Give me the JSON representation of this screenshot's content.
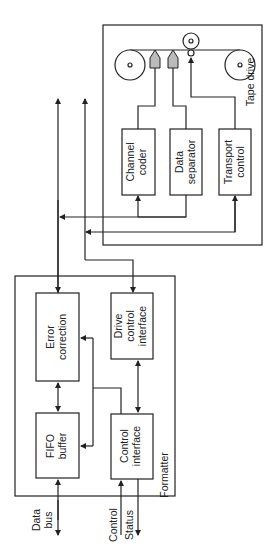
{
  "diagram": {
    "orientation": "rotated 90° counter-clockwise",
    "colors": {
      "line": "#222222",
      "head_fill": "#bbbbbb",
      "background": "#ffffff"
    },
    "formatter": {
      "label": "Formatter",
      "blocks": {
        "fifo": [
          "FIFO",
          "buffer"
        ],
        "error": [
          "Error",
          "correction"
        ],
        "control": [
          "Control",
          "interface"
        ],
        "drive": [
          "Drive",
          "control",
          "interface"
        ]
      }
    },
    "tape_drive": {
      "label": "Tape drive",
      "blocks": {
        "coder": [
          "Channel",
          "coder"
        ],
        "separator": [
          "Data",
          "separator"
        ],
        "transport": [
          "Transport",
          "control"
        ]
      }
    },
    "external": {
      "data_bus": [
        "Data",
        "bus"
      ],
      "control": "Control",
      "status": "Status"
    }
  }
}
